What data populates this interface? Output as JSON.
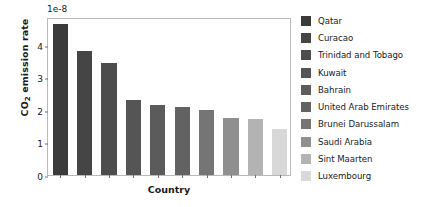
{
  "chart_data": {
    "type": "bar",
    "title": "",
    "xlabel": "Country",
    "ylabel": "CO2 emission rate",
    "offset_text": "1e-8",
    "categories": [
      "Qatar",
      "Curacao",
      "Trinidad and Tobago",
      "Kuwait",
      "Bahrain",
      "United Arab Emirates",
      "Brunei Darussalam",
      "Saudi Arabia",
      "Sint Maarten",
      "Luxembourg"
    ],
    "values": [
      4.65,
      3.8,
      3.45,
      2.3,
      2.15,
      2.1,
      2.0,
      1.75,
      1.73,
      1.4
    ],
    "bar_colors": [
      "#3b3b3b",
      "#454545",
      "#4d4d4d",
      "#555555",
      "#5b5b5b",
      "#626262",
      "#757575",
      "#8f8f8f",
      "#b3b3b3",
      "#d8d8d8"
    ],
    "ylim": [
      0,
      4.85
    ],
    "yticks": [
      0,
      1,
      2,
      3,
      4
    ],
    "ytick_labels": [
      "0",
      "1",
      "2",
      "3",
      "4"
    ],
    "grid": false,
    "legend_position": "right"
  },
  "axis": {
    "y_label_main": "CO",
    "y_label_sub": "2",
    "y_label_rest": " emission rate"
  }
}
